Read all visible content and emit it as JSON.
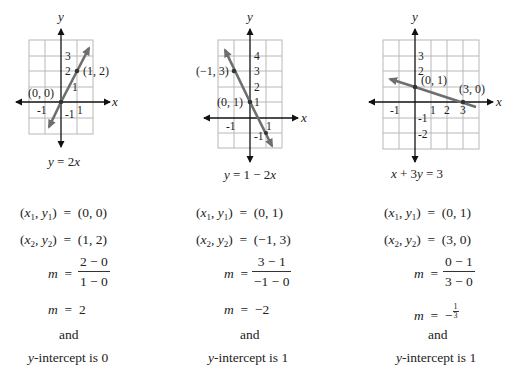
{
  "graphs": [
    {
      "id": "graph-1",
      "equation": "y = 2x",
      "axis_x_label": "x",
      "axis_y_label": "y",
      "x_ticks": [
        "-1",
        "1"
      ],
      "y_ticks": [
        "3",
        "2",
        "1",
        "-1"
      ],
      "points": [
        {
          "label": "(0, 0)",
          "x": 0,
          "y": 0
        },
        {
          "label": "(1, 2)",
          "x": 1,
          "y": 2
        }
      ]
    },
    {
      "id": "graph-2",
      "equation": "y = 1 − 2x",
      "axis_x_label": "x",
      "axis_y_label": "y",
      "x_ticks": [
        "-1",
        "1"
      ],
      "y_ticks": [
        "4",
        "3",
        "2",
        "1",
        "-1"
      ],
      "points": [
        {
          "label": "(−1, 3)",
          "x": -1,
          "y": 3
        },
        {
          "label": "(0, 1)",
          "x": 0,
          "y": 1
        }
      ]
    },
    {
      "id": "graph-3",
      "equation": "x + 3y = 3",
      "axis_x_label": "x",
      "axis_y_label": "y",
      "x_ticks": [
        "-1",
        "1",
        "2",
        "3"
      ],
      "y_ticks": [
        "3",
        "2",
        "-1",
        "-2"
      ],
      "points": [
        {
          "label": "(0, 1)",
          "x": 0,
          "y": 1
        },
        {
          "label": "(3, 0)",
          "x": 3,
          "y": 0
        }
      ]
    }
  ],
  "work": [
    {
      "p1_lhs": "(x₁, y₁)",
      "p1_rhs": "(0, 0)",
      "p2_lhs": "(x₂, y₂)",
      "p2_rhs": "(1, 2)",
      "m": "m",
      "frac_num": "2 − 0",
      "frac_den": "1 − 0",
      "m_value": "2",
      "and": "and",
      "intercept": "y-intercept is 0"
    },
    {
      "p1_lhs": "(x₁, y₁)",
      "p1_rhs": "(0, 1)",
      "p2_lhs": "(x₂, y₂)",
      "p2_rhs": "(−1, 3)",
      "m": "m",
      "frac_num": "3 − 1",
      "frac_den": "−1 − 0",
      "m_value": "−2",
      "and": "and",
      "intercept": "y-intercept is 1"
    },
    {
      "p1_lhs": "(x₁, y₁)",
      "p1_rhs": "(0, 1)",
      "p2_lhs": "(x₂, y₂)",
      "p2_rhs": "(3, 0)",
      "m": "m",
      "frac_num": "0 − 1",
      "frac_den": "3 − 0",
      "m_value": "−",
      "m_value_frac_num": "1",
      "m_value_frac_den": "3",
      "and": "and",
      "intercept": "y-intercept is 1"
    }
  ],
  "colors": {
    "grid": "#b8b8b8",
    "axis": "#111111",
    "line": "#6e6e6e",
    "point": "#333333",
    "text": "#222222"
  }
}
